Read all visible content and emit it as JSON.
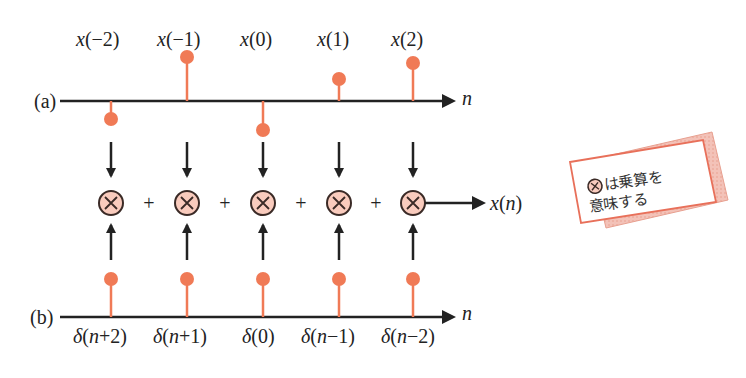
{
  "colors": {
    "stem": "#f07a56",
    "axis": "#222222",
    "multiplier_fill": "#f9cbbd",
    "multiplier_stroke": "#3a2a26",
    "note_border": "#e8705a",
    "note_shadow": "#eeaaa0"
  },
  "panel_a": {
    "label": "(a)",
    "axis_label": "n",
    "samples": [
      {
        "label": "x(−2)",
        "label_var": "x",
        "label_arg": "(−2)",
        "direction": "down",
        "height": 22
      },
      {
        "label": "x(−1)",
        "label_var": "x",
        "label_arg": "(−1)",
        "direction": "up",
        "height": 44
      },
      {
        "label": "x(0)",
        "label_var": "x",
        "label_arg": "(0)",
        "direction": "down",
        "height": 30
      },
      {
        "label": "x(1)",
        "label_var": "x",
        "label_arg": "(1)",
        "direction": "up",
        "height": 22
      },
      {
        "label": "x(2)",
        "label_var": "x",
        "label_arg": "(2)",
        "direction": "up",
        "height": 37
      }
    ]
  },
  "operations": {
    "multiplier_symbol": "×",
    "plus_symbol": "+",
    "output_label": "x(n)",
    "output_var": "x",
    "output_arg": "(n)"
  },
  "panel_b": {
    "label": "(b)",
    "axis_label": "n",
    "samples": [
      {
        "label": "δ(n+2)",
        "var": "δ",
        "arg_open": "(",
        "arg_n": "n",
        "arg_rest": "+2)"
      },
      {
        "label": "δ(n+1)",
        "var": "δ",
        "arg_open": "(",
        "arg_n": "n",
        "arg_rest": "+1)"
      },
      {
        "label": "δ(0)",
        "var": "δ",
        "arg_open": "(0)",
        "arg_n": "",
        "arg_rest": ""
      },
      {
        "label": "δ(n−1)",
        "var": "δ",
        "arg_open": "(",
        "arg_n": "n",
        "arg_rest": "−1)"
      },
      {
        "label": "δ(n−2)",
        "var": "δ",
        "arg_open": "(",
        "arg_n": "n",
        "arg_rest": "−2)"
      }
    ]
  },
  "note": {
    "line1": "は乗算を",
    "line2": "意味する",
    "icon": "multiply-circle-icon"
  }
}
